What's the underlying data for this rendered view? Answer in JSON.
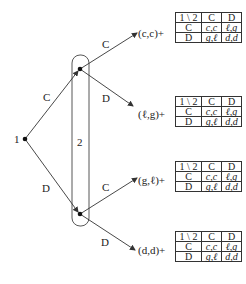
{
  "diagram": {
    "type": "extensive-form game tree",
    "root": {
      "label": "1",
      "x": 25,
      "y": 139
    },
    "info_set": {
      "label": "2",
      "label_x": 77,
      "label_y": 142
    },
    "nodes": {
      "upper": {
        "x": 80,
        "y": 69
      },
      "lower": {
        "x": 80,
        "y": 214
      }
    },
    "root_edges": [
      {
        "label": "C",
        "to": "upper",
        "label_x": 43,
        "label_y": 92
      },
      {
        "label": "D",
        "to": "lower",
        "label_x": 42,
        "label_y": 183
      }
    ],
    "outcomes": [
      {
        "edge_label": "C",
        "edge_label_x": 102,
        "edge_label_y": 39,
        "payoff": "(c,c)+",
        "payoff_x": 138,
        "payoff_y": 28,
        "matrix_y": 12
      },
      {
        "edge_label": "D",
        "edge_label_x": 102,
        "edge_label_y": 93,
        "payoff": "(ℓ,g)+",
        "payoff_x": 138,
        "payoff_y": 109,
        "matrix_y": 96
      },
      {
        "edge_label": "C",
        "edge_label_x": 102,
        "edge_label_y": 182,
        "payoff": "(g,ℓ)+",
        "payoff_x": 138,
        "payoff_y": 175,
        "matrix_y": 161
      },
      {
        "edge_label": "D",
        "edge_label_x": 101,
        "edge_label_y": 237,
        "payoff": "(d,d)+",
        "payoff_x": 138,
        "payoff_y": 245,
        "matrix_y": 231
      }
    ],
    "matrix": {
      "header": [
        "1 \\ 2",
        "C",
        "D"
      ],
      "rows": [
        {
          "label": "C",
          "cells": [
            "c,c",
            "ℓ,g"
          ]
        },
        {
          "label": "D",
          "cells": [
            "g,ℓ",
            "d,d"
          ]
        }
      ]
    },
    "colors": {
      "line": "#333333",
      "node": "#111111",
      "text": "#222222"
    }
  }
}
